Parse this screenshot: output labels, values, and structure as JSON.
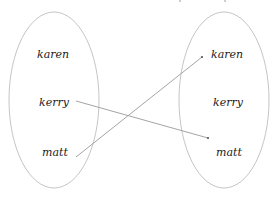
{
  "diagram": {
    "type": "mapping",
    "domain_set": {
      "elements": [
        "karen",
        "kerry",
        "matt"
      ]
    },
    "codomain_set": {
      "elements": [
        "karen",
        "kerry",
        "matt"
      ]
    },
    "mappings": [
      {
        "from": "kerry",
        "to": "matt"
      },
      {
        "from": "matt",
        "to": "karen"
      }
    ],
    "colors": {
      "ellipse_stroke": "#bdbdbd",
      "arrow_stroke": "#9a9a9a",
      "text": "#222222"
    }
  }
}
